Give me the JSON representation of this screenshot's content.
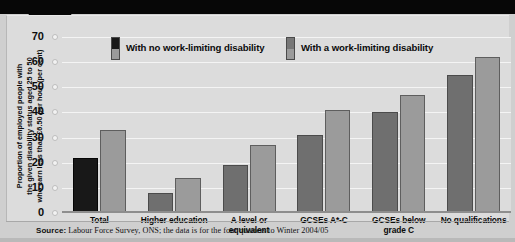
{
  "chart_data": {
    "type": "bar",
    "title": "",
    "subtitle": "",
    "xlabel": "",
    "ylabel": "Proportion of employed people with\nthe given disability status  aged 25 to 50\nwho earn less than £6.50 per hour (per cent)",
    "ylim": [
      0,
      70
    ],
    "yticks": [
      0,
      10,
      20,
      30,
      40,
      50,
      60,
      70
    ],
    "ytick_labels": [
      "0",
      "10",
      "20",
      "30",
      "40",
      "50",
      "60",
      "70"
    ],
    "grid": true,
    "legend_position": "top-inside",
    "categories": [
      "Total",
      "Higher education",
      "A level or\nequivalent",
      "GCSEs A*-C",
      "GCSEs below\ngrade C",
      "No qualifications"
    ],
    "series": [
      {
        "name": "With no work-limiting disability",
        "color": "#6f6f6f",
        "highlight_color": "#181818",
        "values": [
          22,
          8,
          19,
          31,
          40,
          55
        ]
      },
      {
        "name": "With a work-limiting disability",
        "color": "#9b9b9b",
        "values": [
          33,
          14,
          27,
          41,
          47,
          62
        ]
      }
    ],
    "annotations": [],
    "source": "Source: Labour Force Survey, ONS; the data is for the four quarters to Winter 2004/05"
  },
  "legend": {
    "items": [
      {
        "label": "With no work-limiting disability",
        "swatch_top": "#181818",
        "swatch_bottom": "#9b9b9b"
      },
      {
        "label": "With a work-limiting disability",
        "swatch_top": "#777777",
        "swatch_bottom": "#9b9b9b"
      }
    ]
  },
  "footer": {
    "source_prefix": "Source:",
    "source_text": " Labour Force Survey, ONS; the data is for the four quarters to Winter 2004/05"
  },
  "colors": {
    "plot_background": "#dcdcdc",
    "page_background": "#cfcfcf",
    "gridline": "#f4f4f4",
    "band": "#070707",
    "series_1": "#6f6f6f",
    "series_1_highlight": "#181818",
    "series_2": "#9b9b9b"
  }
}
